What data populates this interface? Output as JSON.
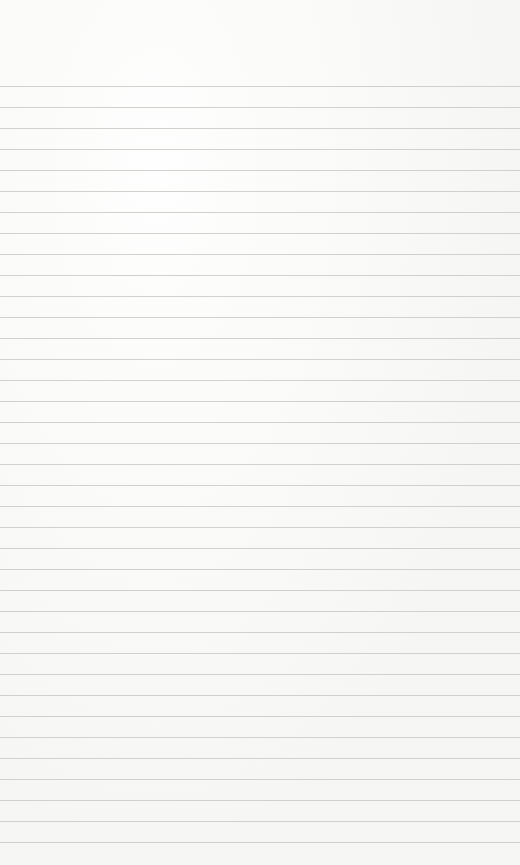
{
  "page": {
    "type": "lined-paper",
    "background_color": "#f7f7f5",
    "line_color": "#c9c9c6",
    "first_line_y": 86,
    "line_spacing": 21,
    "line_count": 37,
    "text": ""
  }
}
